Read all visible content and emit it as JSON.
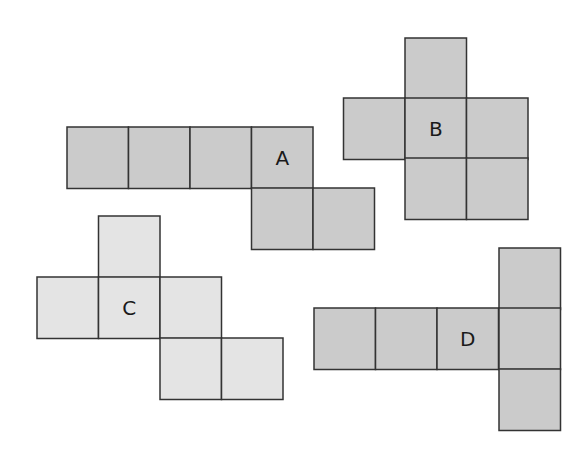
{
  "diagram": {
    "type": "cube-nets",
    "colors": {
      "dark_fill": "#cbcbcb",
      "light_fill": "#e4e4e4",
      "stroke": "#333333"
    },
    "nets": [
      {
        "label": "A",
        "fill": "dark",
        "cells": [
          [
            67,
            127
          ],
          [
            128.5,
            127
          ],
          [
            190,
            127
          ],
          [
            251.5,
            127
          ],
          [
            251.5,
            188
          ],
          [
            313,
            188
          ]
        ],
        "label_cell": 3
      },
      {
        "label": "B",
        "fill": "dark",
        "cells": [
          [
            405,
            38
          ],
          [
            343.5,
            98
          ],
          [
            405,
            98
          ],
          [
            466.5,
            98
          ],
          [
            405,
            158
          ],
          [
            466.5,
            158
          ]
        ],
        "label_cell": 2
      },
      {
        "label": "C",
        "fill": "light",
        "cells": [
          [
            98.5,
            216
          ],
          [
            37,
            277
          ],
          [
            98.5,
            277
          ],
          [
            160,
            277
          ],
          [
            160,
            338
          ],
          [
            221.5,
            338
          ]
        ],
        "label_cell": 2
      },
      {
        "label": "D",
        "fill": "dark",
        "cells": [
          [
            499,
            248
          ],
          [
            314,
            308
          ],
          [
            375.5,
            308
          ],
          [
            437,
            308
          ],
          [
            499,
            308
          ],
          [
            499,
            369
          ]
        ],
        "label_cell": 3
      }
    ],
    "cell_size": 61.5
  }
}
